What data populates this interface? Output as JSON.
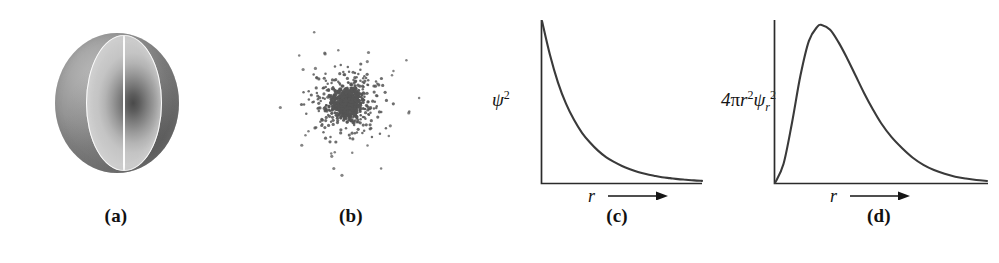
{
  "figure": {
    "background_color": "#ffffff",
    "ink_color": "#2b2b2b"
  },
  "panels": [
    {
      "id": "a",
      "caption": "(a)",
      "kind": "cutaway-sphere",
      "description": "Shaded sphere with a quarter cut away revealing a dark high-density core",
      "colors": {
        "sphere_light": "#b9b9b9",
        "sphere_dark": "#6f6f6f",
        "core_dark": "#4a4a4a",
        "cut_outline": "#fdfdfd"
      }
    },
    {
      "id": "b",
      "caption": "(b)",
      "kind": "dot-density",
      "description": "Electron probability dot-density plot, dense at the nucleus and thinning outward",
      "dot_count": 900,
      "dot_color": "#555555",
      "center": {
        "x": 347,
        "y": 103
      },
      "max_radius": 78
    },
    {
      "id": "c",
      "caption": "(c)",
      "kind": "line-plot",
      "ylabel": "ψ²",
      "xlabel": "r",
      "xlabel_arrow": "→"
    },
    {
      "id": "d",
      "caption": "(d)",
      "kind": "line-plot",
      "ylabel": "4πr²ψr²",
      "xlabel": "r",
      "xlabel_arrow": "→"
    }
  ],
  "chart_data": [
    {
      "type": "line",
      "panel": "c",
      "title": "",
      "xlabel": "r",
      "ylabel": "ψ²",
      "grid": false,
      "legend": null,
      "axis_style": "L-shaped, no tick marks, arrow on x-axis",
      "xlim": [
        0,
        1
      ],
      "ylim": [
        0,
        1
      ],
      "description": "Monotonic exponential decay from a maximum at r = 0 toward zero",
      "x": [
        0.0,
        0.05,
        0.1,
        0.15,
        0.2,
        0.25,
        0.3,
        0.35,
        0.4,
        0.45,
        0.5,
        0.55,
        0.6,
        0.65,
        0.7,
        0.75,
        0.8,
        0.85,
        0.9,
        0.95,
        1.0
      ],
      "values": [
        1.0,
        0.79,
        0.62,
        0.49,
        0.39,
        0.31,
        0.25,
        0.2,
        0.16,
        0.13,
        0.105,
        0.085,
        0.068,
        0.055,
        0.045,
        0.036,
        0.03,
        0.024,
        0.02,
        0.016,
        0.013
      ]
    },
    {
      "type": "line",
      "panel": "d",
      "title": "",
      "xlabel": "r",
      "ylabel": "4πr²ψr²",
      "grid": false,
      "legend": null,
      "axis_style": "L-shaped, no tick marks, arrow on x-axis",
      "xlim": [
        0,
        1
      ],
      "ylim": [
        0,
        1
      ],
      "description": "Radial distribution function: rises from zero, peaks near r = 0.22, then decays with a long tail",
      "peak_x": 0.22,
      "peak_y": 1.0,
      "x": [
        0.0,
        0.04,
        0.08,
        0.12,
        0.16,
        0.2,
        0.22,
        0.26,
        0.3,
        0.34,
        0.38,
        0.42,
        0.46,
        0.5,
        0.55,
        0.6,
        0.65,
        0.7,
        0.75,
        0.8,
        0.85,
        0.9,
        0.95,
        1.0
      ],
      "values": [
        0.0,
        0.12,
        0.38,
        0.68,
        0.9,
        0.99,
        1.0,
        0.97,
        0.89,
        0.79,
        0.68,
        0.57,
        0.47,
        0.38,
        0.29,
        0.22,
        0.16,
        0.115,
        0.082,
        0.058,
        0.04,
        0.028,
        0.019,
        0.013
      ]
    }
  ]
}
